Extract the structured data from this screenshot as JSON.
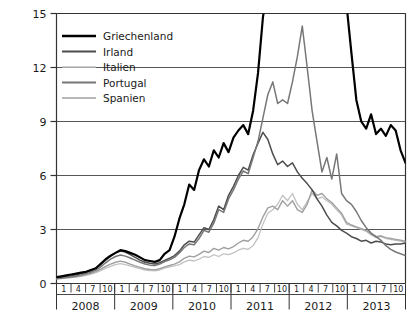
{
  "chart_data": {
    "type": "line",
    "title": "",
    "subtitle": "",
    "xlabel": "",
    "ylabel": "",
    "grid": true,
    "legend_position": "top-left",
    "ylim": [
      0,
      15
    ],
    "yticks": [
      0,
      3,
      6,
      9,
      12,
      15
    ],
    "ytick_labels": [
      "0",
      "3",
      "6",
      "9",
      "12",
      "15"
    ],
    "xlim": [
      2008.0,
      2013.9167
    ],
    "x_year_labels": [
      "2008",
      "2009",
      "2010",
      "2011",
      "2012",
      "2013"
    ],
    "x_month_ticks": [
      "1",
      "4",
      "7",
      "10"
    ],
    "x_month_label_sequence": [
      "1",
      "4",
      "7",
      "10",
      "1",
      "4",
      "7",
      "10",
      "1",
      "4",
      "7",
      "10",
      "1",
      "4",
      "7",
      "10",
      "1",
      "4",
      "7",
      "10",
      "1",
      "4",
      "7",
      "10"
    ],
    "note_clipped_above_axis": "Griechenland exceeds the 15 axis maximum between mid-2011 and early 2013 and is drawn clipped at the top border",
    "colors": {
      "Griechenland": "#000000",
      "Irland": "#4d4d4d",
      "Italien": "#c2c2c2",
      "Portugal": "#777777",
      "Spanien": "#a0a0a0",
      "axis": "#333333",
      "grid": "#555555",
      "background": "#ffffff"
    },
    "line_widths": {
      "Griechenland": 2.2,
      "Irland": 1.5,
      "Italien": 1.3,
      "Portugal": 1.5,
      "Spanien": 1.4
    },
    "x": [
      2008.0,
      2008.0833,
      2008.1667,
      2008.25,
      2008.3333,
      2008.4167,
      2008.5,
      2008.5833,
      2008.6667,
      2008.75,
      2008.8333,
      2008.9167,
      2009.0,
      2009.0833,
      2009.1667,
      2009.25,
      2009.3333,
      2009.4167,
      2009.5,
      2009.5833,
      2009.6667,
      2009.75,
      2009.8333,
      2009.9167,
      2010.0,
      2010.0833,
      2010.1667,
      2010.25,
      2010.3333,
      2010.4167,
      2010.5,
      2010.5833,
      2010.6667,
      2010.75,
      2010.8333,
      2010.9167,
      2011.0,
      2011.0833,
      2011.1667,
      2011.25,
      2011.3333,
      2011.4167,
      2011.5,
      2011.5833,
      2011.6667,
      2011.75,
      2011.8333,
      2011.9167,
      2012.0,
      2012.0833,
      2012.1667,
      2012.25,
      2012.3333,
      2012.4167,
      2012.5,
      2012.5833,
      2012.6667,
      2012.75,
      2012.8333,
      2012.9167,
      2013.0,
      2013.0833,
      2013.1667,
      2013.25,
      2013.3333,
      2013.4167,
      2013.5,
      2013.5833,
      2013.6667,
      2013.75,
      2013.8333,
      2013.9167
    ],
    "series": [
      {
        "name": "Griechenland",
        "values": [
          0.35,
          0.4,
          0.45,
          0.5,
          0.55,
          0.6,
          0.65,
          0.75,
          0.85,
          1.1,
          1.35,
          1.55,
          1.7,
          1.85,
          1.8,
          1.7,
          1.6,
          1.45,
          1.3,
          1.25,
          1.2,
          1.3,
          1.65,
          1.85,
          2.6,
          3.6,
          4.4,
          5.5,
          5.2,
          6.3,
          6.9,
          6.5,
          7.4,
          7.0,
          7.8,
          7.3,
          8.1,
          8.5,
          8.8,
          8.3,
          9.6,
          11.7,
          14.8,
          16.5,
          18.0,
          20.0,
          21.0,
          22.5,
          24.0,
          26.0,
          25.0,
          23.0,
          20.0,
          19.0,
          20.0,
          21.5,
          19.0,
          17.0,
          16.0,
          15.5,
          12.8,
          10.2,
          9.0,
          8.6,
          9.4,
          8.3,
          8.6,
          8.2,
          8.8,
          8.5,
          7.4,
          6.7
        ]
      },
      {
        "name": "Irland",
        "values": [
          0.3,
          0.33,
          0.38,
          0.42,
          0.48,
          0.55,
          0.62,
          0.7,
          0.85,
          1.05,
          1.3,
          1.5,
          1.7,
          1.8,
          1.75,
          1.6,
          1.45,
          1.3,
          1.18,
          1.12,
          1.08,
          1.15,
          1.28,
          1.4,
          1.55,
          1.8,
          2.15,
          2.35,
          2.3,
          2.7,
          3.1,
          3.0,
          3.55,
          4.3,
          4.1,
          4.9,
          5.4,
          6.0,
          6.45,
          6.3,
          7.15,
          7.8,
          8.4,
          8.0,
          7.2,
          6.6,
          6.8,
          6.5,
          6.7,
          6.2,
          5.85,
          5.55,
          5.2,
          4.7,
          4.3,
          3.8,
          3.4,
          3.2,
          2.95,
          2.8,
          2.6,
          2.5,
          2.35,
          2.4,
          2.25,
          2.35,
          2.3,
          2.2,
          2.15,
          2.2,
          2.2,
          2.25
        ]
      },
      {
        "name": "Italien",
        "values": [
          0.25,
          0.27,
          0.3,
          0.33,
          0.36,
          0.4,
          0.45,
          0.52,
          0.6,
          0.72,
          0.85,
          0.95,
          1.05,
          1.1,
          1.05,
          0.98,
          0.9,
          0.82,
          0.75,
          0.72,
          0.7,
          0.75,
          0.85,
          0.92,
          0.98,
          1.05,
          1.2,
          1.3,
          1.25,
          1.35,
          1.5,
          1.45,
          1.6,
          1.5,
          1.65,
          1.6,
          1.7,
          1.85,
          1.95,
          1.9,
          2.1,
          2.55,
          3.3,
          3.9,
          4.1,
          4.4,
          4.9,
          4.6,
          5.0,
          4.4,
          4.1,
          4.55,
          5.0,
          4.7,
          4.8,
          4.6,
          4.4,
          4.1,
          3.8,
          3.3,
          3.2,
          3.1,
          3.0,
          2.9,
          2.7,
          2.55,
          2.6,
          2.5,
          2.45,
          2.4,
          2.35,
          2.3
        ]
      },
      {
        "name": "Portugal",
        "values": [
          0.28,
          0.31,
          0.35,
          0.38,
          0.42,
          0.48,
          0.55,
          0.63,
          0.75,
          0.92,
          1.15,
          1.35,
          1.5,
          1.58,
          1.52,
          1.42,
          1.3,
          1.18,
          1.08,
          1.02,
          1.0,
          1.08,
          1.22,
          1.32,
          1.45,
          1.7,
          2.0,
          2.2,
          2.15,
          2.5,
          2.95,
          2.85,
          3.35,
          4.1,
          3.95,
          4.7,
          5.2,
          5.8,
          6.25,
          6.1,
          7.0,
          7.9,
          9.2,
          10.5,
          11.2,
          10.0,
          10.2,
          10.0,
          11.2,
          12.6,
          14.3,
          12.0,
          9.6,
          7.9,
          6.2,
          7.0,
          5.8,
          7.2,
          5.0,
          4.6,
          4.4,
          4.0,
          3.5,
          3.1,
          2.8,
          2.6,
          2.4,
          2.1,
          1.9,
          1.75,
          1.65,
          1.55
        ]
      },
      {
        "name": "Spanien",
        "values": [
          0.26,
          0.29,
          0.32,
          0.35,
          0.38,
          0.43,
          0.49,
          0.56,
          0.66,
          0.8,
          0.95,
          1.08,
          1.18,
          1.24,
          1.18,
          1.08,
          0.98,
          0.9,
          0.82,
          0.78,
          0.76,
          0.82,
          0.92,
          1.0,
          1.08,
          1.2,
          1.4,
          1.52,
          1.48,
          1.62,
          1.8,
          1.72,
          1.95,
          1.85,
          2.0,
          1.92,
          2.05,
          2.25,
          2.4,
          2.35,
          2.6,
          3.05,
          3.7,
          4.2,
          4.3,
          4.1,
          4.6,
          4.3,
          4.6,
          4.1,
          3.95,
          4.4,
          5.2,
          4.9,
          5.0,
          4.7,
          4.5,
          4.2,
          3.9,
          3.4,
          3.25,
          3.15,
          3.05,
          2.95,
          2.75,
          2.6,
          2.65,
          2.55,
          2.5,
          2.45,
          2.4,
          2.35
        ]
      }
    ],
    "legend": [
      {
        "label": "Griechenland",
        "color": "#000000",
        "width": 2.6
      },
      {
        "label": "Irland",
        "color": "#4d4d4d",
        "width": 1.9
      },
      {
        "label": "Italien",
        "color": "#c2c2c2",
        "width": 1.6
      },
      {
        "label": "Portugal",
        "color": "#777777",
        "width": 1.9
      },
      {
        "label": "Spanien",
        "color": "#a0a0a0",
        "width": 1.7
      }
    ]
  }
}
